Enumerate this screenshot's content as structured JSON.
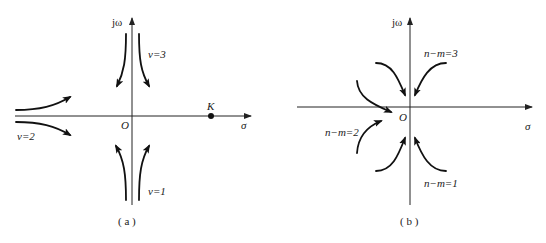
{
  "panels": [
    {
      "id": "a",
      "caption": "( a )",
      "axes": {
        "imag_label": "jω",
        "real_label": "σ",
        "origin_label": "O"
      },
      "point_label": "K",
      "branches": [
        {
          "label": "ν=3",
          "direction": "departing toward real axis from +j∞"
        },
        {
          "label": "ν=2",
          "direction": "arriving from −∞ along real axis"
        },
        {
          "label": "ν=1",
          "direction": "departing toward real axis from −j∞"
        }
      ]
    },
    {
      "id": "b",
      "caption": "( b )",
      "axes": {
        "imag_label": "jω",
        "real_label": "σ",
        "origin_label": "O"
      },
      "branches": [
        {
          "label": "n−m=3"
        },
        {
          "label": "n−m=2"
        },
        {
          "label": "n−m=1"
        }
      ]
    }
  ],
  "colors": {
    "ink": "#111111",
    "background": "#ffffff"
  }
}
